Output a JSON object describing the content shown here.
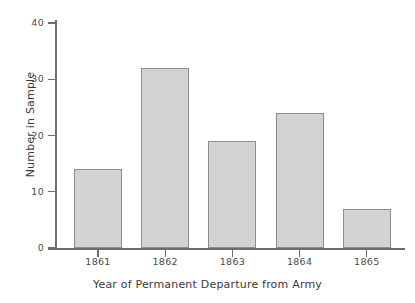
{
  "chart_data": {
    "type": "bar",
    "title": "",
    "subtitle": "",
    "xlabel": "Year of Permanent Departure from Army",
    "ylabel": "Number in Sample",
    "categories": [
      "1861",
      "1862",
      "1863",
      "1864",
      "1865"
    ],
    "values": [
      14,
      32,
      19,
      24,
      7
    ],
    "series": [
      {
        "name": "Number in Sample",
        "values": [
          14,
          32,
          19,
          24,
          7
        ]
      }
    ],
    "ylim": [
      0,
      40
    ],
    "y_ticks": [
      0,
      10,
      20,
      30,
      40
    ],
    "y_tick_labels": [
      "0",
      "10",
      "20",
      "30",
      "40"
    ],
    "x_tick_labels": [
      "1861",
      "1862",
      "1863",
      "1864",
      "1865"
    ],
    "grid": false,
    "legend": false,
    "legend_position": "none",
    "annotations": [],
    "colors": {
      "bar_fill": "#d3d3d3",
      "bar_border": "#8d8d8d",
      "axis": "#6e6e6e",
      "text": "#3a3a3a",
      "background": "#ffffff"
    }
  },
  "axes": {
    "y_title": "Number in Sample",
    "x_title": "Year of Permanent Departure from Army"
  }
}
